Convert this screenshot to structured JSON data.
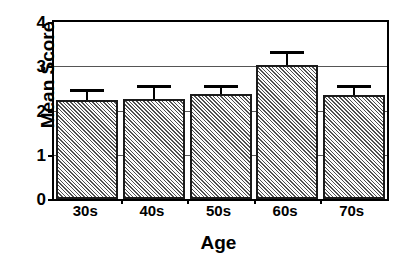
{
  "chart_data": {
    "type": "bar",
    "title": "",
    "subtitle": "",
    "xlabel": "Age",
    "ylabel": "Mean Score",
    "categories": [
      "30s",
      "40s",
      "50s",
      "60s",
      "70s"
    ],
    "values": [
      2.24,
      2.25,
      2.37,
      3.03,
      2.35
    ],
    "error_upper": [
      2.48,
      2.58,
      2.58,
      3.34,
      2.58
    ],
    "error_bars": [
      0.24,
      0.33,
      0.21,
      0.31,
      0.23
    ],
    "series": [
      {
        "name": "Mean Score",
        "values": [
          2.24,
          2.25,
          2.37,
          3.03,
          2.35
        ]
      }
    ],
    "ylim": [
      0,
      4
    ],
    "yticks": [
      0,
      1,
      2,
      3,
      4
    ],
    "ytick_labels": [
      "0",
      "1",
      "2",
      "3",
      "4"
    ],
    "grid": true,
    "grid_axis": "y",
    "legend": false,
    "legend_position": "none",
    "bar_fill": "#b0b0b0",
    "bar_pattern": "diagonal-hatch",
    "bar_edge_color": "#1a1a1a",
    "axis_color": "#000000",
    "background": "#ffffff",
    "error_bar_style": "upper-only-with-cap"
  },
  "axes": {
    "y_title": "Mean Score",
    "x_title": "Age"
  }
}
